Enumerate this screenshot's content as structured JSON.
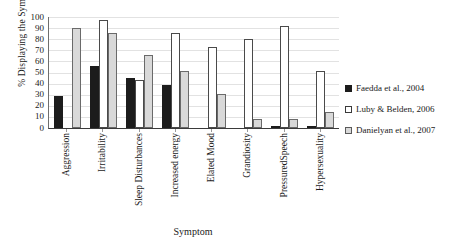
{
  "chart_data": {
    "type": "bar",
    "title": "",
    "xlabel": "Symptom",
    "ylabel": "% Displaying the Symptom",
    "ylim": [
      0,
      100
    ],
    "yticks": [
      100,
      90,
      80,
      70,
      60,
      50,
      40,
      30,
      20,
      10,
      0
    ],
    "grid": true,
    "legend_position": "right",
    "categories": [
      "Aggression",
      "Irritability",
      "Sleep Disturbances",
      "Increased energy",
      "Elated Mood",
      "Grandiosity",
      "PressuredSpeech",
      "Hypersexuality"
    ],
    "series": [
      {
        "name": "Faedda et al., 2004",
        "color": "#1c1c1c",
        "values": [
          29,
          56,
          45,
          39,
          0,
          0,
          1,
          1
        ]
      },
      {
        "name": "Luby & Belden, 2006",
        "color": "#ffffff",
        "values": [
          0,
          97,
          43,
          86,
          73,
          80,
          92,
          51
        ]
      },
      {
        "name": "Danielyan et al., 2007",
        "color": "#d9d9d9",
        "values": [
          90,
          86,
          66,
          51,
          31,
          8,
          8,
          14
        ]
      }
    ]
  },
  "legend": {
    "items": [
      {
        "label": "Faedda et al., 2004"
      },
      {
        "label": "Luby & Belden, 2006"
      },
      {
        "label": "Danielyan et al., 2007"
      }
    ]
  }
}
